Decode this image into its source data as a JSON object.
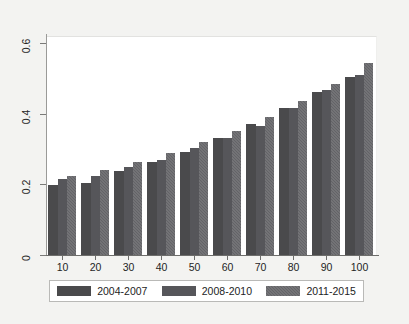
{
  "chart_data": {
    "type": "bar",
    "title": "",
    "subtitle": "",
    "xlabel": "",
    "ylabel": "",
    "categories": [
      "10",
      "20",
      "30",
      "40",
      "50",
      "60",
      "70",
      "80",
      "90",
      "100"
    ],
    "series": [
      {
        "name": "2004-2007",
        "color": "#4a4a4c",
        "values": [
          0.197,
          0.205,
          0.237,
          0.263,
          0.292,
          0.33,
          0.37,
          0.415,
          0.462,
          0.505
        ]
      },
      {
        "name": "2008-2010",
        "color": "#56565a",
        "values": [
          0.215,
          0.225,
          0.248,
          0.27,
          0.302,
          0.332,
          0.365,
          0.415,
          0.466,
          0.51
        ]
      },
      {
        "name": "2011-2015",
        "color": "#636367",
        "values": [
          0.223,
          0.24,
          0.262,
          0.288,
          0.32,
          0.352,
          0.392,
          0.437,
          0.485,
          0.545
        ]
      }
    ],
    "ylim": [
      0,
      0.62
    ],
    "yticks": [
      0,
      0.2,
      0.4,
      0.6
    ],
    "ytick_labels": [
      "0",
      "0.2",
      "0.4",
      "0.6"
    ],
    "xtick_labels": [
      "10",
      "20",
      "30",
      "40",
      "50",
      "60",
      "70",
      "80",
      "90",
      "100"
    ],
    "grid": false,
    "legend_position": "bottom",
    "legend_entries": [
      "2004-2007",
      "2008-2010",
      "2011-2015"
    ]
  },
  "legend": {
    "items": [
      {
        "label": "2004-2007"
      },
      {
        "label": "2008-2010"
      },
      {
        "label": "2011-2015"
      }
    ]
  },
  "axes": {
    "y_labels": [
      "0",
      "0.2",
      "0.4",
      "0.6"
    ],
    "x_labels": [
      "10",
      "20",
      "30",
      "40",
      "50",
      "60",
      "70",
      "80",
      "90",
      "100"
    ]
  }
}
